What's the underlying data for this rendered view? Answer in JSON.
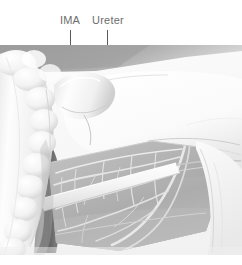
{
  "figure": {
    "type": "anatomical-illustration",
    "palette": {
      "background": "#ffffff",
      "label_text": "#6d6d6d",
      "leader_line": "#5a5a5a",
      "peritoneum_light": "#f4f4f4",
      "tissue_white": "#fbfbfb",
      "mesentery_mid": "#b4b4b4",
      "mesentery_dark": "#8e8e8e",
      "shadow_dark": "#6f6f6f",
      "shadow_deep": "#585858",
      "vessel_pale": "#eceaea",
      "colon_highlight": "#fdfdfd",
      "colon_shade": "#d9d9d9",
      "outline": "#9a9a9a"
    }
  },
  "labels": [
    {
      "id": "ima",
      "text": "IMA",
      "leader": {
        "x": 70,
        "top": 30,
        "length": 46
      }
    },
    {
      "id": "ureter",
      "text": "Ureter",
      "leader": {
        "x": 107,
        "top": 30,
        "length": 155
      }
    }
  ],
  "structures": {
    "colon": "sigmoid colon with haustra",
    "ima_pedicle": "inferior mesenteric artery pedicle",
    "ureter_band": "left ureter crossing the pelvic brim",
    "vascular_arcade": "mesenteric vessel arcade",
    "peritoneal_fold": "peritoneal reflection"
  }
}
